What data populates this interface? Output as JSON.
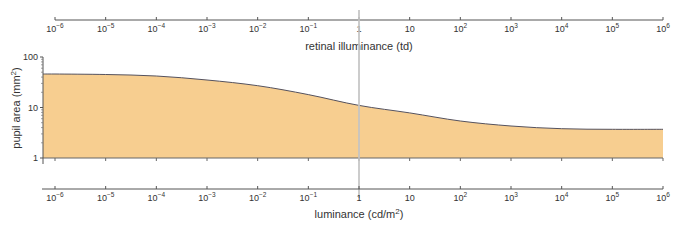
{
  "chart_data": {
    "type": "area",
    "title": "",
    "xlabel_top": "retinal illuminance (td)",
    "xlabel_bottom": "luminance (cd/m2)",
    "xlabel_bottom_base": "luminance (cd/m",
    "xlabel_bottom_sup": "2",
    "xlabel_bottom_tail": ")",
    "ylabel": "pupil area (mm2)",
    "ylabel_base": "pupil area (mm",
    "ylabel_sup": "2",
    "ylabel_tail": ")",
    "xscale": "log",
    "yscale": "log",
    "xlim": [
      1e-06,
      1000000.0
    ],
    "ylim": [
      1,
      100
    ],
    "grid": false,
    "legend": null,
    "x_tick_exponents": [
      -6,
      -5,
      -4,
      -3,
      -2,
      -1,
      0,
      1,
      2,
      3,
      4,
      5,
      6
    ],
    "x_tick_labels": [
      "10-6",
      "10-5",
      "10-4",
      "10-3",
      "10-2",
      "10-1",
      "1",
      "10",
      "102",
      "103",
      "104",
      "105",
      "106"
    ],
    "y_ticks": [
      1,
      10,
      100
    ],
    "y_tick_labels": [
      "1",
      "10",
      "100"
    ],
    "x": [
      1e-06,
      1e-05,
      0.0001,
      0.001,
      0.01,
      0.1,
      1,
      10,
      100,
      1000,
      10000,
      100000,
      1000000
    ],
    "series": [
      {
        "name": "pupil area",
        "values": [
          46,
          45,
          42,
          35,
          27,
          18,
          11,
          7.8,
          5.4,
          4.3,
          3.8,
          3.7,
          3.7
        ]
      }
    ],
    "annotations": [
      {
        "type": "vertical-line",
        "x": 1,
        "color": "#BDBDBD"
      }
    ],
    "colors": {
      "fill": "#F7CE90",
      "stroke": "#55525E",
      "axis": "#555555",
      "marker_line": "#C4C4C4"
    }
  }
}
